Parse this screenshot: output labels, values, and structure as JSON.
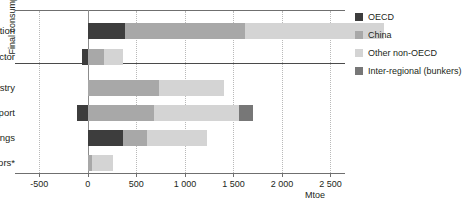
{
  "chart_data": {
    "type": "bar",
    "orientation": "horizontal",
    "stacked": true,
    "title": "",
    "xlabel": "Mtoe",
    "ylabel": "Final consumption",
    "xlim": [
      -750,
      2650
    ],
    "grid": true,
    "legend_position": "right",
    "xticks": [
      -500,
      0,
      500,
      1000,
      1500,
      2000,
      2500
    ],
    "xtick_labels": [
      "-500",
      "0",
      "500",
      "1 000",
      "1 500",
      "2 000",
      "2 500"
    ],
    "categories": [
      "Power generation",
      "Other energy sector",
      "Industry",
      "Transport",
      "Buildings",
      "Other sectors*"
    ],
    "group_labels": {
      "supply": [
        "Power generation",
        "Other energy sector"
      ],
      "final_consumption": [
        "Industry",
        "Transport",
        "Buildings",
        "Other sectors*"
      ]
    },
    "series": [
      {
        "name": "OECD",
        "color": "#3d3d3d",
        "values": [
          380,
          -60,
          0,
          -110,
          360,
          0
        ]
      },
      {
        "name": "China",
        "color": "#a8a8a8",
        "values": [
          1240,
          170,
          730,
          680,
          250,
          40
        ]
      },
      {
        "name": "Other non-OECD",
        "color": "#d4d4d4",
        "values": [
          1430,
          190,
          670,
          880,
          620,
          220
        ]
      },
      {
        "name": "Inter-regional (bunkers)",
        "color": "#777777",
        "values": [
          0,
          0,
          0,
          140,
          0,
          0
        ]
      }
    ]
  },
  "legend": {
    "items": [
      {
        "label": "OECD",
        "color": "#3d3d3d"
      },
      {
        "label": "China",
        "color": "#a8a8a8"
      },
      {
        "label": "Other non-OECD",
        "color": "#d4d4d4"
      },
      {
        "label": "Inter-regional (bunkers)",
        "color": "#777777"
      }
    ]
  },
  "axis": {
    "unit_label": "Mtoe",
    "group_axis_label": "Final consumption"
  }
}
